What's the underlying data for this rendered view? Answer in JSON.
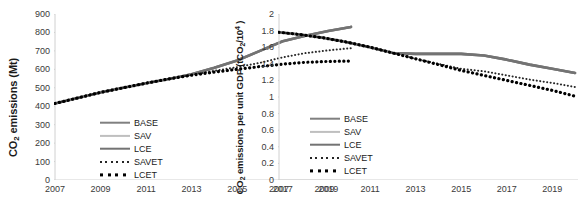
{
  "figure": {
    "panels": [
      {
        "id": "left",
        "ytitle_main": "CO",
        "ytitle_sub": "2",
        "ytitle_rest": " emissions (Mt)",
        "chart_data": {
          "type": "line",
          "title": "",
          "xlabel": "",
          "ylabel": "CO2 emissions (Mt)",
          "xlim": [
            2007,
            2020
          ],
          "ylim": [
            0,
            900
          ],
          "ytick_step": 100,
          "grid": false,
          "legend_position": "inside-bottom-left",
          "x": [
            2007,
            2008,
            2009,
            2010,
            2011,
            2012,
            2013,
            2014,
            2015,
            2016,
            2017,
            2018,
            2019,
            2020
          ],
          "ticks_x": [
            2007,
            2009,
            2011,
            2013,
            2015,
            2017,
            2019
          ],
          "ticks_y": [
            0,
            100,
            200,
            300,
            400,
            500,
            600,
            700,
            800,
            900
          ],
          "series": [
            {
              "name": "BASE",
              "values": [
                415,
                445,
                475,
                500,
                525,
                548,
                573,
                608,
                648,
                700,
                752,
                782,
                808,
                830
              ]
            },
            {
              "name": "SAV",
              "values": [
                415,
                445,
                475,
                500,
                525,
                548,
                573,
                608,
                648,
                700,
                752,
                782,
                808,
                830
              ]
            },
            {
              "name": "LCE",
              "values": [
                415,
                445,
                475,
                500,
                525,
                548,
                573,
                608,
                648,
                700,
                752,
                782,
                808,
                830
              ]
            },
            {
              "name": "SAVET",
              "values": [
                415,
                445,
                475,
                500,
                525,
                548,
                570,
                592,
                612,
                635,
                665,
                688,
                703,
                715
              ]
            },
            {
              "name": "LCET",
              "values": [
                415,
                445,
                475,
                500,
                525,
                548,
                568,
                585,
                600,
                615,
                628,
                638,
                643,
                645
              ]
            }
          ]
        },
        "legend": [
          {
            "label": "BASE",
            "style": "solid",
            "color": "#808080",
            "width": 2.6
          },
          {
            "label": "SAV",
            "style": "solid",
            "color": "#bfbfbf",
            "width": 2.2
          },
          {
            "label": "LCE",
            "style": "solid",
            "color": "#737373",
            "width": 2.6
          },
          {
            "label": "SAVET",
            "style": "dotted-fine",
            "color": "#262626",
            "width": 2.0
          },
          {
            "label": "LCET",
            "style": "dotted-bold",
            "color": "#000000",
            "width": 3.2
          }
        ]
      },
      {
        "id": "right",
        "ytitle_main": "CO",
        "ytitle_sub": "2",
        "ytitle_rest": " emissions per unit GDP (tCO",
        "ytitle_sub2": "2",
        "ytitle_rest2": "/10",
        "ytitle_sup": "4",
        "ytitle_rest3": " )",
        "chart_data": {
          "type": "line",
          "title": "",
          "xlabel": "",
          "ylabel": "CO2 emissions per unit GDP (tCO2/10^4)",
          "xlim": [
            2007,
            2020
          ],
          "ylim": [
            0,
            2
          ],
          "ytick_step": 0.2,
          "grid": false,
          "legend_position": "inside-bottom-left",
          "x": [
            2007,
            2008,
            2009,
            2010,
            2011,
            2012,
            2013,
            2014,
            2015,
            2016,
            2017,
            2018,
            2019,
            2020
          ],
          "ticks_x": [
            2007,
            2009,
            2011,
            2013,
            2015,
            2017,
            2019
          ],
          "ticks_y": [
            0,
            0.2,
            0.4,
            0.6,
            0.8,
            1,
            1.2,
            1.4,
            1.6,
            1.8,
            2
          ],
          "series": [
            {
              "name": "BASE",
              "values": [
                1.78,
                1.75,
                1.71,
                1.66,
                1.6,
                1.53,
                1.52,
                1.52,
                1.52,
                1.5,
                1.45,
                1.39,
                1.34,
                1.29
              ]
            },
            {
              "name": "SAV",
              "values": [
                1.78,
                1.75,
                1.71,
                1.66,
                1.6,
                1.53,
                1.52,
                1.52,
                1.52,
                1.5,
                1.45,
                1.39,
                1.34,
                1.29
              ]
            },
            {
              "name": "LCE",
              "values": [
                1.78,
                1.75,
                1.71,
                1.66,
                1.6,
                1.53,
                1.52,
                1.52,
                1.52,
                1.5,
                1.45,
                1.39,
                1.34,
                1.29
              ]
            },
            {
              "name": "SAVET",
              "values": [
                1.78,
                1.75,
                1.71,
                1.66,
                1.6,
                1.53,
                1.46,
                1.4,
                1.34,
                1.31,
                1.26,
                1.21,
                1.17,
                1.12
              ]
            },
            {
              "name": "LCET",
              "values": [
                1.78,
                1.75,
                1.71,
                1.66,
                1.6,
                1.53,
                1.46,
                1.39,
                1.32,
                1.26,
                1.2,
                1.14,
                1.08,
                1.01
              ]
            }
          ]
        },
        "legend": [
          {
            "label": "BASE",
            "style": "solid",
            "color": "#808080",
            "width": 2.6
          },
          {
            "label": "SAV",
            "style": "solid",
            "color": "#bfbfbf",
            "width": 2.2
          },
          {
            "label": "LCE",
            "style": "solid",
            "color": "#737373",
            "width": 2.6
          },
          {
            "label": "SAVET",
            "style": "dotted-fine",
            "color": "#262626",
            "width": 2.0
          },
          {
            "label": "LCET",
            "style": "dotted-bold",
            "color": "#000000",
            "width": 3.2
          }
        ]
      }
    ],
    "axis_color": "#d0d0d0",
    "tick_text_color": "#3a3a3a"
  }
}
